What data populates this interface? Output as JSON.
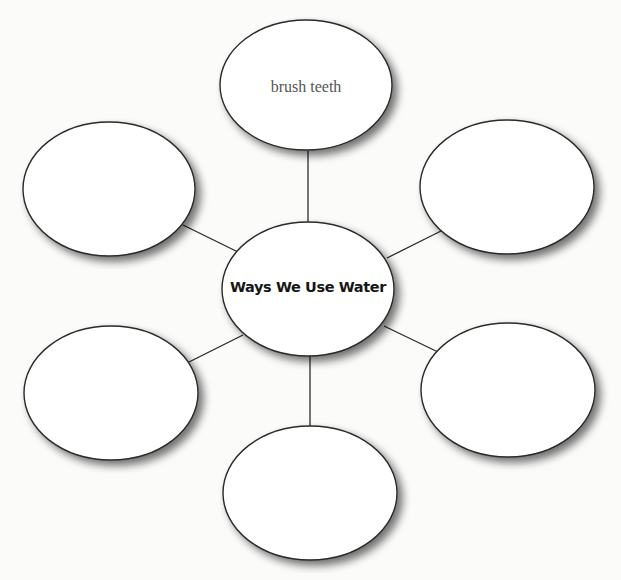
{
  "diagram": {
    "type": "web-organizer",
    "center": {
      "label": "Ways We Use Water",
      "cx": 308,
      "cy": 289,
      "rx": 86,
      "ry": 67
    },
    "nodes": [
      {
        "id": "top",
        "label": "brush teeth",
        "cx": 306,
        "cy": 85,
        "rx": 86,
        "ry": 65
      },
      {
        "id": "upper-left",
        "label": "",
        "cx": 109,
        "cy": 189,
        "rx": 86,
        "ry": 67
      },
      {
        "id": "upper-right",
        "label": "",
        "cx": 507,
        "cy": 187,
        "rx": 87,
        "ry": 67
      },
      {
        "id": "lower-left",
        "label": "",
        "cx": 111,
        "cy": 393,
        "rx": 87,
        "ry": 67
      },
      {
        "id": "lower-right",
        "label": "",
        "cx": 508,
        "cy": 390,
        "rx": 87,
        "ry": 67
      },
      {
        "id": "bottom",
        "label": "",
        "cx": 310,
        "cy": 493,
        "rx": 87,
        "ry": 67
      }
    ],
    "connectors": [
      {
        "to": "top",
        "x1": 308,
        "y1": 223,
        "x2": 308,
        "y2": 151
      },
      {
        "to": "upper-left",
        "x1": 238,
        "y1": 252,
        "x2": 183,
        "y2": 225
      },
      {
        "to": "upper-right",
        "x1": 387,
        "y1": 258,
        "x2": 441,
        "y2": 231
      },
      {
        "to": "lower-left",
        "x1": 243,
        "y1": 335,
        "x2": 189,
        "y2": 362
      },
      {
        "to": "lower-right",
        "x1": 384,
        "y1": 326,
        "x2": 438,
        "y2": 352
      },
      {
        "to": "bottom",
        "x1": 310,
        "y1": 356,
        "x2": 310,
        "y2": 426
      }
    ],
    "colors": {
      "stroke": "#2a2a2a",
      "fill": "#ffffff",
      "shadow": "#7a7a7a",
      "background": "#fbfbfa"
    }
  }
}
